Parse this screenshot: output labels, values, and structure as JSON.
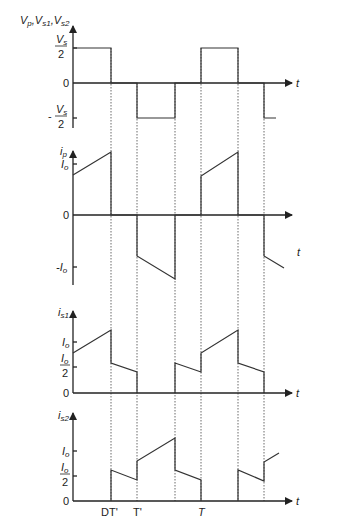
{
  "diagram": {
    "time_axis_label": "t",
    "time_markers": [
      "DT'",
      "T'",
      "T"
    ],
    "panels": [
      {
        "id": "voltage",
        "ylabel": "V_p, V_s1, V_s2",
        "ylabel_parts": [
          "V",
          "p",
          ",V",
          "s1",
          ",V",
          "s2"
        ],
        "ticks": [
          {
            "label": "V_s / 2",
            "num": "V",
            "num_sub": "s",
            "den": "2",
            "value": 0.5
          },
          {
            "label": "0",
            "value": 0
          },
          {
            "label": "- V_s / 2",
            "prefix": "-",
            "num": "V",
            "num_sub": "s",
            "den": "2",
            "value": -0.5
          }
        ],
        "waveform_description": "Square wave: +Vs/2 from 0 to DT', 0 to T', -Vs/2 until ~T'+DT', 0, +Vs/2 from T to T+DT', 0, -Vs/2 from ...",
        "points": [
          [
            0,
            0.5
          ],
          [
            1,
            0.5
          ],
          [
            1,
            0
          ],
          [
            1.7,
            0
          ],
          [
            1.7,
            -0.5
          ],
          [
            2.7,
            -0.5
          ],
          [
            2.7,
            0
          ],
          [
            3.4,
            0
          ],
          [
            3.4,
            0.5
          ],
          [
            4.4,
            0.5
          ],
          [
            4.4,
            0
          ],
          [
            5.1,
            0
          ],
          [
            5.1,
            -0.5
          ],
          [
            5.6,
            -0.5
          ]
        ]
      },
      {
        "id": "primary-current",
        "ylabel": "i_p",
        "ylabel_parts": [
          "i",
          "p"
        ],
        "ticks": [
          {
            "label": "I_o",
            "main": "I",
            "sub": "o",
            "value": 1
          },
          {
            "label": "0",
            "value": 0
          },
          {
            "label": "-I_o",
            "prefix": "-",
            "main": "I",
            "sub": "o",
            "value": -1
          }
        ]
      },
      {
        "id": "switch1-current",
        "ylabel": "i_s1",
        "ylabel_parts": [
          "i",
          "s1"
        ],
        "ticks": [
          {
            "label": "I_o",
            "main": "I",
            "sub": "o",
            "value": 1
          },
          {
            "label": "I_o / 2",
            "num": "I",
            "num_sub": "o",
            "den": "2",
            "value": 0.5
          },
          {
            "label": "0",
            "value": 0
          }
        ]
      },
      {
        "id": "switch2-current",
        "ylabel": "i_s2",
        "ylabel_parts": [
          "i",
          "s2"
        ],
        "ticks": [
          {
            "label": "I_o",
            "main": "I",
            "sub": "o",
            "value": 1
          },
          {
            "label": "I_o / 2",
            "num": "I",
            "num_sub": "o",
            "den": "2",
            "value": 0.5
          },
          {
            "label": "0",
            "value": 0
          }
        ]
      }
    ]
  }
}
